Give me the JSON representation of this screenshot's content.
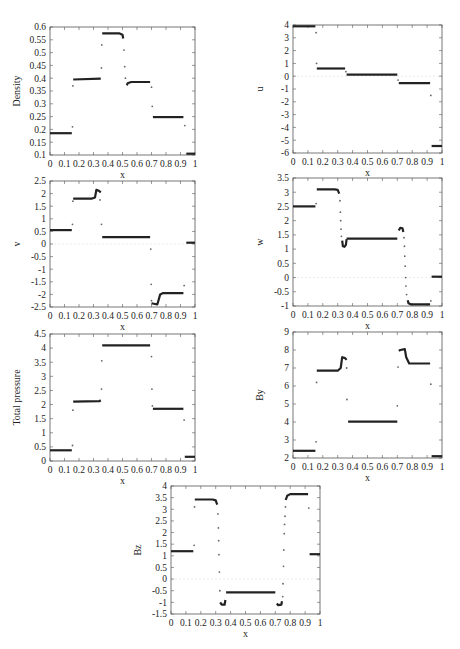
{
  "chart_data": [
    {
      "id": "density",
      "type": "scatter",
      "title": "",
      "xlabel": "x",
      "ylabel": "Density",
      "xlim": [
        0,
        1
      ],
      "ylim": [
        0.1,
        0.6
      ],
      "xticks": [
        "0",
        "0.1",
        "0.2",
        "0.3",
        "0.4",
        "0.5",
        "0.6",
        "0.7",
        "0.8",
        "0.9",
        "1"
      ],
      "yticks": [
        "0.1",
        "0.15",
        "0.2",
        "0.25",
        "0.3",
        "0.35",
        "0.4",
        "0.45",
        "0.5",
        "0.55",
        "0.6"
      ],
      "box": [
        50,
        27,
        195,
        155
      ],
      "segments": [
        {
          "x": [
            0,
            0.15
          ],
          "y": [
            0.185,
            0.185
          ]
        },
        {
          "x": [
            0.16,
            0.35
          ],
          "y": [
            0.395,
            0.398
          ]
        },
        {
          "x": [
            0.36,
            0.48,
            0.5,
            0.505
          ],
          "y": [
            0.575,
            0.575,
            0.57,
            0.555
          ]
        },
        {
          "x": [
            0.53,
            0.535,
            0.56,
            0.69
          ],
          "y": [
            0.372,
            0.38,
            0.385,
            0.385
          ]
        },
        {
          "x": [
            0.71,
            0.92
          ],
          "y": [
            0.248,
            0.248
          ]
        },
        {
          "x": [
            0.94,
            1.0
          ],
          "y": [
            0.105,
            0.105
          ]
        }
      ],
      "points": [
        {
          "x": 0.155,
          "y": 0.21
        },
        {
          "x": 0.158,
          "y": 0.37
        },
        {
          "x": 0.355,
          "y": 0.44
        },
        {
          "x": 0.357,
          "y": 0.53
        },
        {
          "x": 0.51,
          "y": 0.51
        },
        {
          "x": 0.515,
          "y": 0.445
        },
        {
          "x": 0.52,
          "y": 0.4
        },
        {
          "x": 0.7,
          "y": 0.365
        },
        {
          "x": 0.705,
          "y": 0.29
        },
        {
          "x": 0.93,
          "y": 0.215
        }
      ]
    },
    {
      "id": "u",
      "type": "scatter",
      "xlabel": "x",
      "ylabel": "u",
      "xlim": [
        0,
        1
      ],
      "ylim": [
        -6,
        4
      ],
      "xticks": [
        "0",
        "0.1",
        "0.2",
        "0.3",
        "0.4",
        "0.5",
        "0.6",
        "0.7",
        "0.8",
        "0.9",
        "1"
      ],
      "yticks": [
        "-6",
        "-5",
        "-4",
        "-3",
        "-2",
        "-1",
        "0",
        "1",
        "2",
        "3",
        "4"
      ],
      "box": [
        293,
        25,
        442,
        153
      ],
      "segments": [
        {
          "x": [
            0,
            0.15
          ],
          "y": [
            3.9,
            3.9
          ]
        },
        {
          "x": [
            0.16,
            0.35
          ],
          "y": [
            0.6,
            0.6
          ]
        },
        {
          "x": [
            0.36,
            0.7
          ],
          "y": [
            0.12,
            0.12
          ]
        },
        {
          "x": [
            0.71,
            0.92
          ],
          "y": [
            -0.55,
            -0.55
          ]
        },
        {
          "x": [
            0.93,
            1.0
          ],
          "y": [
            -5.45,
            -5.45
          ]
        }
      ],
      "points": [
        {
          "x": 0.155,
          "y": 3.4
        },
        {
          "x": 0.158,
          "y": 1.0
        },
        {
          "x": 0.355,
          "y": 0.35
        },
        {
          "x": 0.705,
          "y": -0.3
        },
        {
          "x": 0.925,
          "y": -1.5
        }
      ]
    },
    {
      "id": "v",
      "type": "scatter",
      "xlabel": "x",
      "ylabel": "v",
      "xlim": [
        0,
        1
      ],
      "ylim": [
        -2.5,
        2.5
      ],
      "xticks": [
        "0",
        "0.1",
        "0.2",
        "0.3",
        "0.4",
        "0.5",
        "0.6",
        "0.7",
        "0.8",
        "0.9",
        "1"
      ],
      "yticks": [
        "-2.5",
        "-2",
        "-1.5",
        "-1",
        "-0.5",
        "0",
        "0.5",
        "1",
        "1.5",
        "2",
        "2.5"
      ],
      "box": [
        50,
        181,
        195,
        307
      ],
      "segments": [
        {
          "x": [
            0,
            0.15
          ],
          "y": [
            0.55,
            0.55
          ]
        },
        {
          "x": [
            0.16,
            0.29,
            0.31,
            0.32,
            0.34,
            0.35
          ],
          "y": [
            1.8,
            1.8,
            1.85,
            2.15,
            2.1,
            2.05
          ]
        },
        {
          "x": [
            0.36,
            0.69
          ],
          "y": [
            0.27,
            0.27
          ]
        },
        {
          "x": [
            0.7,
            0.74,
            0.76,
            0.78,
            0.92
          ],
          "y": [
            -2.35,
            -2.4,
            -2.0,
            -1.95,
            -1.95
          ]
        },
        {
          "x": [
            0.94,
            1.0
          ],
          "y": [
            0.05,
            0.05
          ]
        }
      ],
      "points": [
        {
          "x": 0.155,
          "y": 0.78
        },
        {
          "x": 0.158,
          "y": 1.7
        },
        {
          "x": 0.345,
          "y": 1.75
        },
        {
          "x": 0.355,
          "y": 0.78
        },
        {
          "x": 0.695,
          "y": -0.2
        },
        {
          "x": 0.698,
          "y": -1.6
        },
        {
          "x": 0.7,
          "y": -2.25
        },
        {
          "x": 0.925,
          "y": -1.65
        }
      ]
    },
    {
      "id": "w",
      "type": "scatter",
      "xlabel": "x",
      "ylabel": "w",
      "xlim": [
        0,
        1
      ],
      "ylim": [
        -1,
        3.5
      ],
      "xticks": [
        "0",
        "0.1",
        "0.2",
        "0.3",
        "0.4",
        "0.5",
        "0.6",
        "0.7",
        "0.8",
        "0.9",
        "1"
      ],
      "yticks": [
        "-1",
        "-0.5",
        "0",
        "0.5",
        "1",
        "1.5",
        "2",
        "2.5",
        "3",
        "3.5"
      ],
      "box": [
        293,
        178,
        442,
        306
      ],
      "segments": [
        {
          "x": [
            0,
            0.15
          ],
          "y": [
            2.5,
            2.5
          ]
        },
        {
          "x": [
            0.16,
            0.28,
            0.3,
            0.31
          ],
          "y": [
            3.1,
            3.1,
            3.08,
            2.95
          ]
        },
        {
          "x": [
            0.33,
            0.335,
            0.345,
            0.355,
            0.36
          ],
          "y": [
            1.3,
            1.1,
            1.08,
            1.15,
            1.35
          ]
        },
        {
          "x": [
            0.36,
            0.7
          ],
          "y": [
            1.37,
            1.37
          ]
        },
        {
          "x": [
            0.71,
            0.72,
            0.735,
            0.74
          ],
          "y": [
            1.65,
            1.75,
            1.73,
            1.6
          ]
        },
        {
          "x": [
            0.77,
            0.775,
            0.79,
            0.92
          ],
          "y": [
            -0.8,
            -0.9,
            -0.94,
            -0.94
          ]
        },
        {
          "x": [
            0.93,
            1.0
          ],
          "y": [
            0.03,
            0.03
          ]
        }
      ],
      "points": [
        {
          "x": 0.155,
          "y": 2.6
        },
        {
          "x": 0.315,
          "y": 2.7
        },
        {
          "x": 0.318,
          "y": 2.3
        },
        {
          "x": 0.32,
          "y": 2.0
        },
        {
          "x": 0.322,
          "y": 1.7
        },
        {
          "x": 0.325,
          "y": 1.45
        },
        {
          "x": 0.745,
          "y": 1.4
        },
        {
          "x": 0.748,
          "y": 1.1
        },
        {
          "x": 0.75,
          "y": 0.75
        },
        {
          "x": 0.753,
          "y": 0.4
        },
        {
          "x": 0.756,
          "y": 0.0
        },
        {
          "x": 0.758,
          "y": -0.3
        },
        {
          "x": 0.762,
          "y": -0.6
        },
        {
          "x": 0.925,
          "y": -0.82
        }
      ]
    },
    {
      "id": "total_pressure",
      "type": "scatter",
      "xlabel": "x",
      "ylabel": "Total pressure",
      "xlim": [
        0,
        1
      ],
      "ylim": [
        0,
        4.5
      ],
      "xticks": [
        "0",
        "0.1",
        "0.2",
        "0.3",
        "0.4",
        "0.5",
        "0.6",
        "0.7",
        "0.8",
        "0.9",
        "1"
      ],
      "yticks": [
        "0",
        "0.5",
        "1",
        "1.5",
        "2",
        "2.5",
        "3",
        "3.5",
        "4",
        "4.5"
      ],
      "box": [
        50,
        334,
        195,
        461
      ],
      "segments": [
        {
          "x": [
            0,
            0.15
          ],
          "y": [
            0.38,
            0.38
          ]
        },
        {
          "x": [
            0.16,
            0.34,
            0.35
          ],
          "y": [
            2.1,
            2.12,
            2.15
          ]
        },
        {
          "x": [
            0.36,
            0.69
          ],
          "y": [
            4.1,
            4.1
          ]
        },
        {
          "x": [
            0.71,
            0.92
          ],
          "y": [
            1.85,
            1.85
          ]
        },
        {
          "x": [
            0.93,
            1.0
          ],
          "y": [
            0.15,
            0.15
          ]
        }
      ],
      "points": [
        {
          "x": 0.155,
          "y": 0.55
        },
        {
          "x": 0.158,
          "y": 1.8
        },
        {
          "x": 0.355,
          "y": 2.55
        },
        {
          "x": 0.357,
          "y": 3.55
        },
        {
          "x": 0.7,
          "y": 3.7
        },
        {
          "x": 0.703,
          "y": 2.55
        },
        {
          "x": 0.706,
          "y": 1.95
        },
        {
          "x": 0.925,
          "y": 1.45
        }
      ]
    },
    {
      "id": "By",
      "type": "scatter",
      "xlabel": "x",
      "ylabel": "By",
      "xlim": [
        0,
        1
      ],
      "ylim": [
        2,
        9
      ],
      "xticks": [
        "0",
        "0.1",
        "0.2",
        "0.3",
        "0.4",
        "0.5",
        "0.6",
        "0.7",
        "0.8",
        "0.9",
        "1"
      ],
      "yticks": [
        "2",
        "3",
        "4",
        "5",
        "6",
        "7",
        "8",
        "9"
      ],
      "box": [
        293,
        332,
        442,
        458
      ],
      "segments": [
        {
          "x": [
            0,
            0.15
          ],
          "y": [
            2.4,
            2.4
          ]
        },
        {
          "x": [
            0.16,
            0.3,
            0.32,
            0.33,
            0.35,
            0.36
          ],
          "y": [
            6.85,
            6.85,
            7.0,
            7.6,
            7.55,
            7.45
          ]
        },
        {
          "x": [
            0.37,
            0.7
          ],
          "y": [
            4.02,
            4.02
          ]
        },
        {
          "x": [
            0.71,
            0.72,
            0.75,
            0.76,
            0.78,
            0.92
          ],
          "y": [
            7.95,
            8.0,
            8.05,
            7.6,
            7.25,
            7.25
          ]
        },
        {
          "x": [
            0.93,
            1.0
          ],
          "y": [
            2.1,
            2.1
          ]
        }
      ],
      "points": [
        {
          "x": 0.155,
          "y": 2.9
        },
        {
          "x": 0.158,
          "y": 6.2
        },
        {
          "x": 0.36,
          "y": 7.0
        },
        {
          "x": 0.362,
          "y": 5.25
        },
        {
          "x": 0.7,
          "y": 4.9
        },
        {
          "x": 0.705,
          "y": 7.05
        },
        {
          "x": 0.925,
          "y": 6.1
        }
      ]
    },
    {
      "id": "Bz",
      "type": "scatter",
      "xlabel": "x",
      "ylabel": "Bz",
      "xlim": [
        0,
        1
      ],
      "ylim": [
        -1.5,
        4
      ],
      "xticks": [
        "0",
        "0.1",
        "0.2",
        "0.3",
        "0.4",
        "0.5",
        "0.6",
        "0.7",
        "0.8",
        "0.9",
        "1"
      ],
      "yticks": [
        "-1.5",
        "-1",
        "-0.5",
        "0",
        "0.5",
        "1",
        "1.5",
        "2",
        "2.5",
        "3",
        "3.5",
        "4"
      ],
      "box": [
        171,
        486,
        320,
        614
      ],
      "segments": [
        {
          "x": [
            0,
            0.15
          ],
          "y": [
            1.2,
            1.2
          ]
        },
        {
          "x": [
            0.16,
            0.28,
            0.3,
            0.31
          ],
          "y": [
            3.42,
            3.42,
            3.38,
            3.2
          ]
        },
        {
          "x": [
            0.33,
            0.34,
            0.36,
            0.365
          ],
          "y": [
            -1.0,
            -1.1,
            -1.1,
            -0.9
          ]
        },
        {
          "x": [
            0.37,
            0.7
          ],
          "y": [
            -0.57,
            -0.57
          ]
        },
        {
          "x": [
            0.71,
            0.72,
            0.74,
            0.745
          ],
          "y": [
            -1.05,
            -1.12,
            -1.1,
            -0.95
          ]
        },
        {
          "x": [
            0.77,
            0.78,
            0.8,
            0.92
          ],
          "y": [
            3.4,
            3.58,
            3.65,
            3.65
          ]
        },
        {
          "x": [
            0.93,
            1.0
          ],
          "y": [
            1.07,
            1.07
          ]
        }
      ],
      "points": [
        {
          "x": 0.155,
          "y": 1.45
        },
        {
          "x": 0.158,
          "y": 3.1
        },
        {
          "x": 0.315,
          "y": 2.8
        },
        {
          "x": 0.318,
          "y": 2.2
        },
        {
          "x": 0.32,
          "y": 1.65
        },
        {
          "x": 0.322,
          "y": 1.05
        },
        {
          "x": 0.325,
          "y": 0.3
        },
        {
          "x": 0.328,
          "y": -0.5
        },
        {
          "x": 0.75,
          "y": -0.75
        },
        {
          "x": 0.752,
          "y": -0.2
        },
        {
          "x": 0.755,
          "y": 0.55
        },
        {
          "x": 0.757,
          "y": 1.25
        },
        {
          "x": 0.76,
          "y": 1.95
        },
        {
          "x": 0.762,
          "y": 2.35
        },
        {
          "x": 0.765,
          "y": 2.7
        },
        {
          "x": 0.768,
          "y": 3.1
        },
        {
          "x": 0.925,
          "y": 3.05
        }
      ]
    }
  ]
}
